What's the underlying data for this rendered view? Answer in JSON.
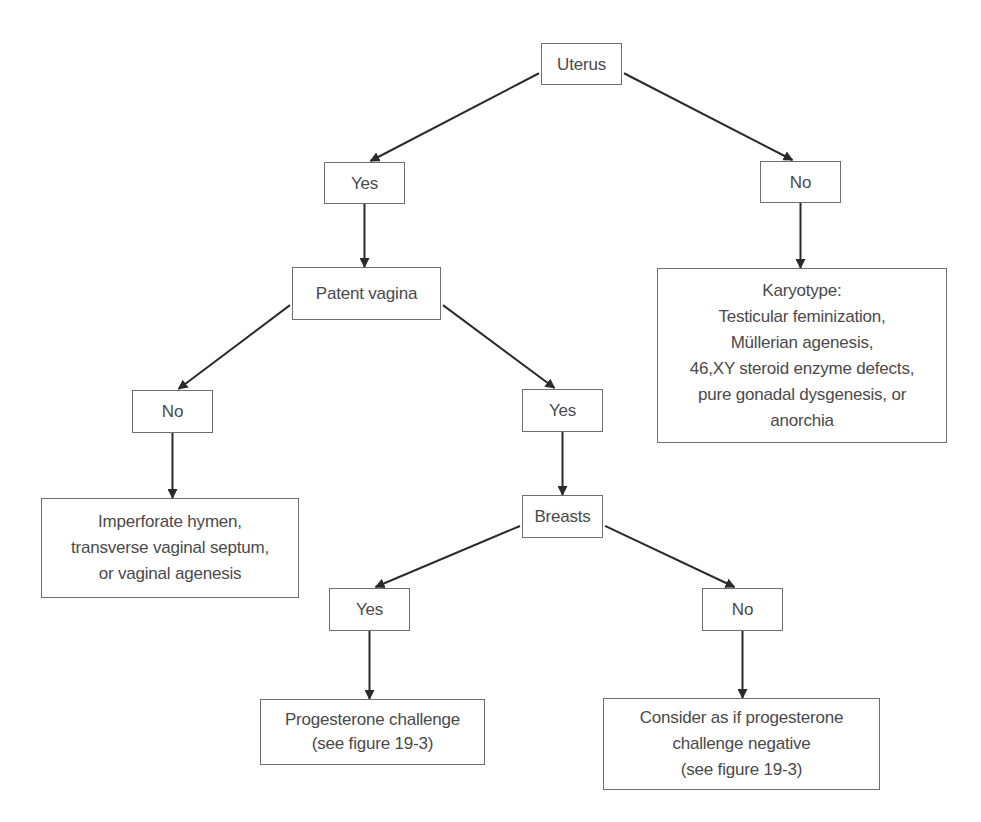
{
  "diagram": {
    "type": "decision-tree",
    "nodes": {
      "uterus": "Uterus",
      "uterus_yes": "Yes",
      "uterus_no": "No",
      "patent_vagina": "Patent vagina",
      "karyotype": "Karyotype:\nTesticular feminization,\nMüllerian agenesis,\n46,XY steroid enzyme defects,\npure gonadal dysgenesis, or\nanorchia",
      "vagina_no": "No",
      "vagina_yes": "Yes",
      "imperforate": "Imperforate hymen,\ntransverse vaginal septum,\nor vaginal agenesis",
      "breasts": "Breasts",
      "breasts_yes": "Yes",
      "breasts_no": "No",
      "progesterone": "Progesterone challenge\n(see figure 19-3)",
      "consider": "Consider as if progesterone\nchallenge negative\n(see figure 19-3)"
    },
    "edges": [
      [
        "uterus",
        "uterus_yes"
      ],
      [
        "uterus",
        "uterus_no"
      ],
      [
        "uterus_yes",
        "patent_vagina"
      ],
      [
        "uterus_no",
        "karyotype"
      ],
      [
        "patent_vagina",
        "vagina_no"
      ],
      [
        "patent_vagina",
        "vagina_yes"
      ],
      [
        "vagina_no",
        "imperforate"
      ],
      [
        "vagina_yes",
        "breasts"
      ],
      [
        "breasts",
        "breasts_yes"
      ],
      [
        "breasts",
        "breasts_no"
      ],
      [
        "breasts_yes",
        "progesterone"
      ],
      [
        "breasts_no",
        "consider"
      ]
    ],
    "colors": {
      "line": "#2b2b2b",
      "border": "#6e6e6e",
      "text": "#4a4a4a"
    }
  }
}
